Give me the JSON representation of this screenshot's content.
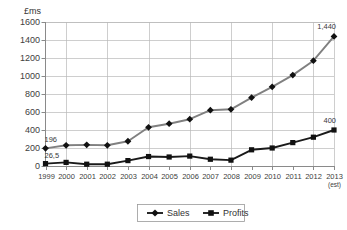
{
  "chart_data": {
    "type": "line",
    "title": "",
    "xlabel": "",
    "ylabel": "£ms",
    "ylim": [
      0,
      1600
    ],
    "yticks": [
      0,
      200,
      400,
      600,
      800,
      1000,
      1200,
      1400,
      1600
    ],
    "ytick_labels": [
      "0",
      "200",
      "400",
      "600",
      "800",
      "1000",
      "1200",
      "1400",
      "1600"
    ],
    "grid": true,
    "legend_position": "bottom",
    "categories": [
      "1999",
      "2000",
      "2001",
      "2002",
      "2003",
      "2004",
      "2005",
      "2006",
      "2007",
      "2008",
      "2009",
      "2010",
      "2011",
      "2012",
      "2013"
    ],
    "category_sublabels": [
      "",
      "",
      "",
      "",
      "",
      "",
      "",
      "",
      "",
      "",
      "",
      "",
      "",
      "",
      "(est)"
    ],
    "series": [
      {
        "name": "Sales",
        "marker": "diamond",
        "color": "#808080",
        "values": [
          196,
          230,
          235,
          230,
          275,
          430,
          470,
          520,
          620,
          630,
          760,
          880,
          1010,
          1170,
          1440
        ]
      },
      {
        "name": "Profits",
        "marker": "square",
        "color": "#1a1a1a",
        "values": [
          26.5,
          40,
          20,
          20,
          60,
          105,
          100,
          110,
          75,
          65,
          180,
          200,
          260,
          320,
          400
        ]
      }
    ],
    "annotations": [
      {
        "text": "196",
        "series": "Sales",
        "index": 0,
        "position": "above-left"
      },
      {
        "text": "26,5",
        "series": "Profits",
        "index": 0,
        "position": "above-left"
      },
      {
        "text": "1,440",
        "series": "Sales",
        "index": 14,
        "position": "above"
      },
      {
        "text": "400",
        "series": "Profits",
        "index": 14,
        "position": "above"
      }
    ]
  },
  "legend": {
    "items": [
      {
        "label": "Sales",
        "marker": "diamond"
      },
      {
        "label": "Profits",
        "marker": "square"
      }
    ]
  }
}
